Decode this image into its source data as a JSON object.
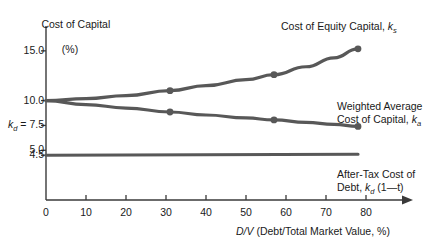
{
  "chart_data": {
    "type": "line",
    "title": "",
    "xlabel": "D/V (Debt/Total Market Value, %)",
    "ylabel": "Cost of Capital (%)",
    "ylabel_line1": "Cost of Capital",
    "ylabel_line2": "(%)",
    "xlim": [
      0,
      85
    ],
    "ylim": [
      0,
      17.5
    ],
    "grid": false,
    "legend_position": "inline-annotations",
    "xticks": [
      0,
      10,
      20,
      30,
      40,
      50,
      60,
      70,
      80
    ],
    "xticklabels": [
      "0",
      "10",
      "20",
      "30",
      "40",
      "50",
      "60",
      "70",
      "80"
    ],
    "yticks": [
      4.5,
      5.0,
      7.5,
      10.0,
      15.0
    ],
    "yticklabels": [
      "4.5",
      "5.0",
      "7.5",
      "10.0",
      "15.0"
    ],
    "ytick_prefix_7_5": "k",
    "ytick_prefix_7_5_sub": "d",
    "ytick_prefix_7_5_eq": " = ",
    "series": [
      {
        "name": "Cost of Equity Capital, ks",
        "label_line1": "Cost of Equity Capital, ",
        "label_sym": "k",
        "label_sub": "s",
        "color": "#585858",
        "x": [
          0,
          10,
          20,
          31,
          40,
          50,
          57,
          65,
          72,
          78
        ],
        "values": [
          10.0,
          10.2,
          10.5,
          11.0,
          11.5,
          12.1,
          12.6,
          13.4,
          14.3,
          15.2
        ],
        "markers_x": [
          31,
          57,
          78
        ],
        "markers_y": [
          11.0,
          12.6,
          15.2
        ]
      },
      {
        "name": "Weighted Average Cost of Capital, ka",
        "label_line1": "Weighted Average",
        "label_line2": "Cost of Capital, ",
        "label_sym": "k",
        "label_sub": "a",
        "color": "#585858",
        "x": [
          0,
          10,
          20,
          31,
          40,
          50,
          57,
          65,
          72,
          78
        ],
        "values": [
          10.0,
          9.6,
          9.25,
          8.85,
          8.55,
          8.25,
          8.05,
          7.8,
          7.6,
          7.4
        ],
        "markers_x": [
          31,
          57,
          78
        ],
        "markers_y": [
          8.85,
          8.05,
          7.4
        ]
      },
      {
        "name": "After-Tax Cost of Debt, kd (1-t)",
        "label_line1": "After-Tax Cost of",
        "label_line2": "Debt, ",
        "label_sym": "k",
        "label_sub": "d",
        "label_tail": " (1—t)",
        "color": "#585858",
        "x": [
          0,
          78
        ],
        "values": [
          4.5,
          4.6
        ],
        "markers_x": [],
        "markers_y": []
      }
    ],
    "axis_color": "#3a3a3a",
    "line_color": "#585858",
    "background": "#ffffff"
  }
}
